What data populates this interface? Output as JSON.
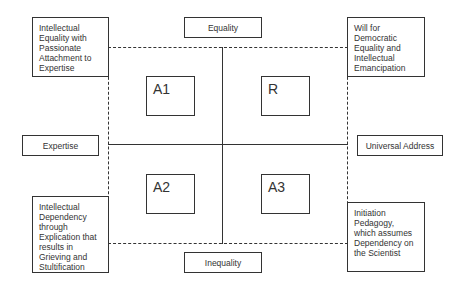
{
  "diagram": {
    "axes": {
      "top": "Equality",
      "bottom": "Inequality",
      "left": "Expertise",
      "right": "Universal Address"
    },
    "quadrants": {
      "top_left": "A1",
      "top_right": "R",
      "bottom_left": "A2",
      "bottom_right": "A3"
    },
    "corner_notes": {
      "top_left": "Intellectual Equality with Passionate Attachment to Expertise",
      "top_right": "Will for Democratic Equality and Intellectual Emancipation",
      "bottom_left": "Intellectual Dependency through Explication that results in Grieving and Stultification",
      "bottom_right": "Initiation Pedagogy, which assumes Dependency on the Scientist"
    },
    "colors": {
      "stroke": "#333333",
      "background": "#ffffff"
    }
  }
}
